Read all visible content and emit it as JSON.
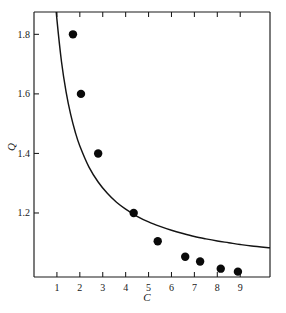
{
  "chart_data": {
    "type": "scatter",
    "title": "",
    "xlabel": "C",
    "ylabel": "Q",
    "xlim": [
      0.0,
      10.3
    ],
    "ylim": [
      0.985,
      1.875
    ],
    "grid": false,
    "legend": "none",
    "x_ticks": [
      1,
      2,
      3,
      4,
      5,
      6,
      7,
      8,
      9
    ],
    "x_tick_labels": [
      "1",
      "2",
      "3",
      "4",
      "5",
      "6",
      "7",
      "8",
      "9"
    ],
    "y_ticks": [
      1.2,
      1.4,
      1.6,
      1.8
    ],
    "y_tick_labels": [
      "1.2",
      "1.4",
      "1.6",
      "1.8"
    ],
    "series": [
      {
        "name": "measured points",
        "marker": "filled-circle",
        "color": "#0a0a0a",
        "x": [
          1.7,
          2.05,
          2.8,
          4.35,
          5.4,
          6.6,
          7.25,
          8.15,
          8.9
        ],
        "y": [
          1.8,
          1.6,
          1.4,
          1.2,
          1.105,
          1.053,
          1.037,
          1.013,
          1.003
        ]
      },
      {
        "name": "fitted curve",
        "marker": "none",
        "style": "solid-line",
        "color": "#141414",
        "formula": "Q = 1 + 0.85 / C",
        "x": [
          0.7,
          0.8,
          0.9,
          1.0,
          1.2,
          1.4,
          1.6,
          1.8,
          2.0,
          2.4,
          2.8,
          3.2,
          3.6,
          4.0,
          4.5,
          5.0,
          5.5,
          6.0,
          6.5,
          7.0,
          7.5,
          8.0,
          8.5,
          9.0,
          9.5,
          10.3
        ],
        "y": [
          2.214,
          2.063,
          1.944,
          1.85,
          1.708,
          1.607,
          1.531,
          1.472,
          1.425,
          1.354,
          1.304,
          1.266,
          1.236,
          1.213,
          1.189,
          1.17,
          1.155,
          1.142,
          1.131,
          1.121,
          1.113,
          1.106,
          1.1,
          1.094,
          1.089,
          1.083
        ]
      }
    ]
  },
  "axes": {
    "y_axis_label": "Q",
    "x_axis_label": "C"
  },
  "colors": {
    "background": "#ffffff",
    "ink": "#1a1a1a",
    "marker": "#0a0a0a",
    "curve": "#141414"
  }
}
